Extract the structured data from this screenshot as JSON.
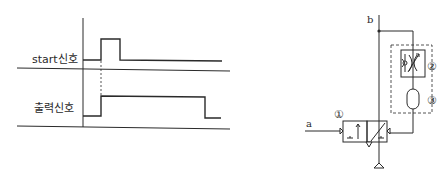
{
  "timing_diagram": {
    "signals": [
      {
        "label": "start신호",
        "description": "short pulse"
      },
      {
        "label": "출력신호",
        "description": "delayed-off output"
      }
    ]
  },
  "circuit": {
    "port_labels": {
      "input": "a",
      "output": "b"
    },
    "component_numbers": [
      "①",
      "②",
      "③"
    ],
    "components": [
      {
        "number": "①",
        "name": "3/2-way pilot valve"
      },
      {
        "number": "②",
        "name": "one-way flow control (throttle-check) valve"
      },
      {
        "number": "③",
        "name": "air reservoir"
      }
    ]
  },
  "colors": {
    "line": "#2a2a2a",
    "background": "#ffffff"
  }
}
